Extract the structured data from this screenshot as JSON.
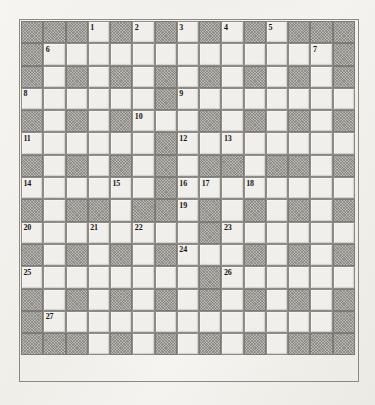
{
  "puzzle": {
    "type": "crossword-grid",
    "title": "Crossword puzzle grid",
    "columns": 15,
    "rows": 15,
    "colors": {
      "paper": "#f3f2ee",
      "white_cell": "#f0efeb",
      "block_cell": "#b9b7b1",
      "grid_line": "#8d8b86",
      "number_text": "#171614"
    },
    "legend": {
      "block": "shaded (unused) square",
      "white": "fillable letter square"
    },
    "clue_numbers": [
      1,
      2,
      3,
      4,
      5,
      6,
      7,
      8,
      9,
      10,
      11,
      12,
      13,
      14,
      15,
      16,
      17,
      18,
      19,
      20,
      21,
      22,
      23,
      24,
      25,
      26,
      27
    ],
    "grid": [
      [
        {
          "t": "block"
        },
        {
          "t": "block"
        },
        {
          "t": "block"
        },
        {
          "t": "white",
          "n": "1"
        },
        {
          "t": "block"
        },
        {
          "t": "white",
          "n": "2"
        },
        {
          "t": "block"
        },
        {
          "t": "white",
          "n": "3"
        },
        {
          "t": "block"
        },
        {
          "t": "white",
          "n": "4"
        },
        {
          "t": "block"
        },
        {
          "t": "white",
          "n": "5"
        },
        {
          "t": "block"
        },
        {
          "t": "block"
        },
        {
          "t": "block"
        }
      ],
      [
        {
          "t": "block"
        },
        {
          "t": "white",
          "n": "6"
        },
        {
          "t": "white"
        },
        {
          "t": "white"
        },
        {
          "t": "white"
        },
        {
          "t": "white"
        },
        {
          "t": "white"
        },
        {
          "t": "white"
        },
        {
          "t": "white"
        },
        {
          "t": "white"
        },
        {
          "t": "white"
        },
        {
          "t": "white"
        },
        {
          "t": "white"
        },
        {
          "t": "white",
          "n": "7"
        },
        {
          "t": "block"
        }
      ],
      [
        {
          "t": "block"
        },
        {
          "t": "white"
        },
        {
          "t": "block"
        },
        {
          "t": "white"
        },
        {
          "t": "block"
        },
        {
          "t": "white"
        },
        {
          "t": "block"
        },
        {
          "t": "white"
        },
        {
          "t": "block"
        },
        {
          "t": "white"
        },
        {
          "t": "block"
        },
        {
          "t": "white"
        },
        {
          "t": "block"
        },
        {
          "t": "white"
        },
        {
          "t": "block"
        }
      ],
      [
        {
          "t": "white",
          "n": "8"
        },
        {
          "t": "white"
        },
        {
          "t": "white"
        },
        {
          "t": "white"
        },
        {
          "t": "white"
        },
        {
          "t": "white"
        },
        {
          "t": "block"
        },
        {
          "t": "white",
          "n": "9"
        },
        {
          "t": "white"
        },
        {
          "t": "white"
        },
        {
          "t": "white"
        },
        {
          "t": "white"
        },
        {
          "t": "white"
        },
        {
          "t": "white"
        },
        {
          "t": "white"
        }
      ],
      [
        {
          "t": "block"
        },
        {
          "t": "white"
        },
        {
          "t": "block"
        },
        {
          "t": "white"
        },
        {
          "t": "block"
        },
        {
          "t": "white",
          "n": "10"
        },
        {
          "t": "white"
        },
        {
          "t": "white"
        },
        {
          "t": "block"
        },
        {
          "t": "white"
        },
        {
          "t": "block"
        },
        {
          "t": "white"
        },
        {
          "t": "block"
        },
        {
          "t": "white"
        },
        {
          "t": "block"
        }
      ],
      [
        {
          "t": "white",
          "n": "11"
        },
        {
          "t": "white"
        },
        {
          "t": "white"
        },
        {
          "t": "white"
        },
        {
          "t": "white"
        },
        {
          "t": "white"
        },
        {
          "t": "block"
        },
        {
          "t": "white",
          "n": "12"
        },
        {
          "t": "white"
        },
        {
          "t": "white",
          "n": "13"
        },
        {
          "t": "white"
        },
        {
          "t": "white"
        },
        {
          "t": "white"
        },
        {
          "t": "white"
        },
        {
          "t": "white"
        }
      ],
      [
        {
          "t": "block"
        },
        {
          "t": "white"
        },
        {
          "t": "block"
        },
        {
          "t": "white"
        },
        {
          "t": "block"
        },
        {
          "t": "white"
        },
        {
          "t": "block"
        },
        {
          "t": "white"
        },
        {
          "t": "block"
        },
        {
          "t": "block"
        },
        {
          "t": "white"
        },
        {
          "t": "block"
        },
        {
          "t": "block"
        },
        {
          "t": "white"
        },
        {
          "t": "block"
        }
      ],
      [
        {
          "t": "white",
          "n": "14"
        },
        {
          "t": "white"
        },
        {
          "t": "white"
        },
        {
          "t": "white"
        },
        {
          "t": "white",
          "n": "15"
        },
        {
          "t": "white"
        },
        {
          "t": "block"
        },
        {
          "t": "white",
          "n": "16"
        },
        {
          "t": "white",
          "n": "17"
        },
        {
          "t": "white"
        },
        {
          "t": "white",
          "n": "18"
        },
        {
          "t": "white"
        },
        {
          "t": "white"
        },
        {
          "t": "white"
        },
        {
          "t": "white"
        }
      ],
      [
        {
          "t": "block"
        },
        {
          "t": "white"
        },
        {
          "t": "block"
        },
        {
          "t": "block"
        },
        {
          "t": "white"
        },
        {
          "t": "block"
        },
        {
          "t": "block"
        },
        {
          "t": "white",
          "n": "19"
        },
        {
          "t": "block"
        },
        {
          "t": "white"
        },
        {
          "t": "block"
        },
        {
          "t": "white"
        },
        {
          "t": "block"
        },
        {
          "t": "white"
        },
        {
          "t": "block"
        }
      ],
      [
        {
          "t": "white",
          "n": "20"
        },
        {
          "t": "white"
        },
        {
          "t": "white"
        },
        {
          "t": "white",
          "n": "21"
        },
        {
          "t": "white"
        },
        {
          "t": "white",
          "n": "22"
        },
        {
          "t": "white"
        },
        {
          "t": "white"
        },
        {
          "t": "block"
        },
        {
          "t": "white",
          "n": "23"
        },
        {
          "t": "white"
        },
        {
          "t": "white"
        },
        {
          "t": "white"
        },
        {
          "t": "white"
        },
        {
          "t": "white"
        }
      ],
      [
        {
          "t": "block"
        },
        {
          "t": "white"
        },
        {
          "t": "block"
        },
        {
          "t": "white"
        },
        {
          "t": "block"
        },
        {
          "t": "white"
        },
        {
          "t": "block"
        },
        {
          "t": "white",
          "n": "24"
        },
        {
          "t": "white"
        },
        {
          "t": "white"
        },
        {
          "t": "block"
        },
        {
          "t": "white"
        },
        {
          "t": "block"
        },
        {
          "t": "white"
        },
        {
          "t": "block"
        }
      ],
      [
        {
          "t": "white",
          "n": "25"
        },
        {
          "t": "white"
        },
        {
          "t": "white"
        },
        {
          "t": "white"
        },
        {
          "t": "white"
        },
        {
          "t": "white"
        },
        {
          "t": "white"
        },
        {
          "t": "white"
        },
        {
          "t": "block"
        },
        {
          "t": "white",
          "n": "26"
        },
        {
          "t": "white"
        },
        {
          "t": "white"
        },
        {
          "t": "white"
        },
        {
          "t": "white"
        },
        {
          "t": "white"
        }
      ],
      [
        {
          "t": "block"
        },
        {
          "t": "white"
        },
        {
          "t": "block"
        },
        {
          "t": "white"
        },
        {
          "t": "block"
        },
        {
          "t": "white"
        },
        {
          "t": "block"
        },
        {
          "t": "white"
        },
        {
          "t": "block"
        },
        {
          "t": "white"
        },
        {
          "t": "block"
        },
        {
          "t": "white"
        },
        {
          "t": "block"
        },
        {
          "t": "white"
        },
        {
          "t": "block"
        }
      ],
      [
        {
          "t": "block"
        },
        {
          "t": "white",
          "n": "27"
        },
        {
          "t": "white"
        },
        {
          "t": "white"
        },
        {
          "t": "white"
        },
        {
          "t": "white"
        },
        {
          "t": "white"
        },
        {
          "t": "white"
        },
        {
          "t": "white"
        },
        {
          "t": "white"
        },
        {
          "t": "white"
        },
        {
          "t": "white"
        },
        {
          "t": "white"
        },
        {
          "t": "white"
        },
        {
          "t": "block"
        }
      ],
      [
        {
          "t": "block"
        },
        {
          "t": "block"
        },
        {
          "t": "block"
        },
        {
          "t": "white"
        },
        {
          "t": "block"
        },
        {
          "t": "white"
        },
        {
          "t": "block"
        },
        {
          "t": "white"
        },
        {
          "t": "block"
        },
        {
          "t": "white"
        },
        {
          "t": "block"
        },
        {
          "t": "white"
        },
        {
          "t": "block"
        },
        {
          "t": "block"
        },
        {
          "t": "block"
        }
      ]
    ]
  }
}
